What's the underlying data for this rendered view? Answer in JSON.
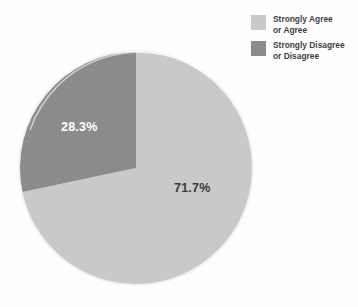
{
  "chart_data": {
    "type": "pie",
    "title": "",
    "subtitle": "",
    "xlabel": "",
    "ylabel": "",
    "grid": false,
    "legend_position": "top-right",
    "start_angle_deg": 0,
    "direction": "clockwise",
    "categories": [
      "Strongly Agree or Agree",
      "Strongly Disagree or Disagree"
    ],
    "values": [
      71.7,
      28.3
    ],
    "value_labels": [
      "71.7%",
      "28.3%"
    ],
    "colors": [
      "#c9c9c9",
      "#8b8b8b"
    ],
    "slices": [
      {
        "name": "Strongly Agree or Agree",
        "value": 71.7,
        "label": "71.7%",
        "color": "#c9c9c9",
        "label_color": "#3a3a3a"
      },
      {
        "name": "Strongly Disagree or Disagree",
        "value": 28.3,
        "label": "28.3%",
        "color": "#8b8b8b",
        "label_color": "#ffffff"
      }
    ]
  },
  "legend": {
    "items": [
      {
        "label": "Strongly Agree\nor Agree",
        "color": "#c9c9c9"
      },
      {
        "label": "Strongly Disagree\nor Disagree",
        "color": "#8b8b8b"
      }
    ]
  },
  "colors": {
    "background": "#fefefe",
    "light_slice": "#c9c9c9",
    "dark_slice": "#8b8b8b",
    "outline": "#f4f4f4",
    "legend_text": "#3f3f3f"
  }
}
